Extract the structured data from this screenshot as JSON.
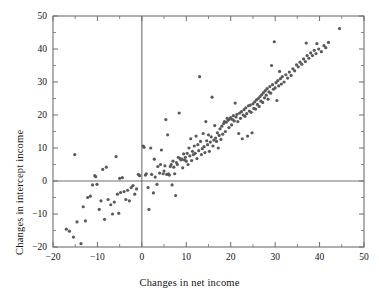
{
  "chart_data": {
    "type": "scatter",
    "title": "",
    "xlabel": "Changes in net income",
    "ylabel": "Changes in intercept income",
    "xlim": [
      -20,
      50
    ],
    "ylim": [
      -20,
      50
    ],
    "xticks": [
      -20,
      -10,
      0,
      10,
      20,
      30,
      40,
      50
    ],
    "yticks": [
      -20,
      -10,
      0,
      10,
      20,
      30,
      40,
      50
    ],
    "xticklabels": [
      "−20",
      "−10",
      "0",
      "10",
      "20",
      "30",
      "40",
      "50"
    ],
    "yticklabels": [
      "−20",
      "−10",
      "0",
      "10",
      "20",
      "30",
      "40",
      "50"
    ],
    "minor_tick_step": 5,
    "grid": false,
    "legend": null,
    "reference_lines": [
      {
        "axis": "horizontal",
        "value": 0
      },
      {
        "axis": "vertical",
        "value": 0
      }
    ],
    "marker": {
      "shape": "dot",
      "size": 1.6,
      "color": "#5a5a5a"
    },
    "frame_color": "#6e6e6e",
    "background": "#ffffff",
    "n_points": 224,
    "points": [
      [
        -17.0,
        -14.6
      ],
      [
        -16.3,
        -15.2
      ],
      [
        -15.4,
        -17.0
      ],
      [
        -15.1,
        8.0
      ],
      [
        -14.6,
        -12.4
      ],
      [
        -13.7,
        -19.0
      ],
      [
        -13.2,
        -7.8
      ],
      [
        -12.7,
        -12.1
      ],
      [
        -12.2,
        -5.0
      ],
      [
        -11.6,
        -4.6
      ],
      [
        -11.1,
        -1.2
      ],
      [
        -10.6,
        1.6
      ],
      [
        -10.4,
        1.3
      ],
      [
        -10.1,
        -1.0
      ],
      [
        -9.6,
        -8.6
      ],
      [
        -9.2,
        -6.0
      ],
      [
        -8.8,
        3.5
      ],
      [
        -8.4,
        -11.6
      ],
      [
        -8.0,
        4.2
      ],
      [
        -7.6,
        -5.6
      ],
      [
        -7.0,
        -7.2
      ],
      [
        -6.6,
        -10.0
      ],
      [
        -6.2,
        -6.4
      ],
      [
        -5.8,
        7.4
      ],
      [
        -5.5,
        -4.0
      ],
      [
        -5.2,
        -9.8
      ],
      [
        -5.0,
        0.8
      ],
      [
        -4.8,
        -3.5
      ],
      [
        -4.4,
        1.0
      ],
      [
        -4.0,
        -3.2
      ],
      [
        -3.6,
        -5.6
      ],
      [
        -3.2,
        -2.8
      ],
      [
        -2.8,
        -6.0
      ],
      [
        -2.4,
        -2.0
      ],
      [
        -2.0,
        -1.4
      ],
      [
        -1.6,
        -4.0
      ],
      [
        -1.2,
        -2.4
      ],
      [
        -0.8,
        2.0
      ],
      [
        -0.5,
        1.6
      ],
      [
        0.3,
        10.6
      ],
      [
        0.5,
        10.2
      ],
      [
        0.8,
        1.8
      ],
      [
        1.0,
        2.2
      ],
      [
        1.4,
        -2.0
      ],
      [
        1.6,
        -8.6
      ],
      [
        2.0,
        10.0
      ],
      [
        2.2,
        2.0
      ],
      [
        2.6,
        -3.6
      ],
      [
        2.8,
        6.6
      ],
      [
        3.0,
        1.2
      ],
      [
        3.4,
        -1.0
      ],
      [
        3.6,
        4.4
      ],
      [
        4.0,
        2.4
      ],
      [
        4.2,
        5.0
      ],
      [
        4.4,
        9.4
      ],
      [
        4.8,
        2.2
      ],
      [
        5.0,
        3.0
      ],
      [
        5.2,
        4.6
      ],
      [
        5.4,
        18.6
      ],
      [
        5.6,
        2.0
      ],
      [
        5.8,
        14.0
      ],
      [
        6.0,
        2.2
      ],
      [
        6.2,
        1.8
      ],
      [
        6.4,
        4.4
      ],
      [
        6.6,
        5.0
      ],
      [
        6.8,
        -1.2
      ],
      [
        7.0,
        6.0
      ],
      [
        7.2,
        4.2
      ],
      [
        7.4,
        2.2
      ],
      [
        7.6,
        -4.4
      ],
      [
        7.8,
        5.6
      ],
      [
        8.0,
        5.0
      ],
      [
        8.2,
        7.2
      ],
      [
        8.4,
        20.6
      ],
      [
        8.6,
        6.8
      ],
      [
        8.8,
        6.4
      ],
      [
        9.0,
        6.6
      ],
      [
        9.2,
        4.0
      ],
      [
        9.4,
        8.2
      ],
      [
        9.6,
        6.4
      ],
      [
        9.8,
        7.2
      ],
      [
        10.0,
        6.0
      ],
      [
        10.2,
        8.4
      ],
      [
        10.4,
        5.0
      ],
      [
        10.6,
        10.0
      ],
      [
        10.8,
        7.6
      ],
      [
        11.0,
        12.8
      ],
      [
        11.2,
        6.2
      ],
      [
        11.4,
        9.0
      ],
      [
        11.6,
        8.0
      ],
      [
        11.8,
        10.6
      ],
      [
        12.0,
        8.4
      ],
      [
        12.2,
        13.6
      ],
      [
        12.4,
        6.8
      ],
      [
        12.6,
        11.0
      ],
      [
        12.8,
        9.2
      ],
      [
        13.0,
        31.6
      ],
      [
        13.2,
        12.0
      ],
      [
        13.4,
        8.0
      ],
      [
        13.6,
        9.8
      ],
      [
        13.8,
        14.4
      ],
      [
        14.0,
        10.4
      ],
      [
        14.2,
        8.6
      ],
      [
        14.4,
        18.0
      ],
      [
        14.6,
        12.2
      ],
      [
        14.8,
        11.0
      ],
      [
        15.0,
        14.0
      ],
      [
        15.2,
        9.0
      ],
      [
        15.4,
        11.8
      ],
      [
        15.6,
        13.4
      ],
      [
        15.8,
        25.4
      ],
      [
        16.0,
        10.6
      ],
      [
        16.2,
        12.4
      ],
      [
        16.4,
        16.8
      ],
      [
        16.6,
        13.0
      ],
      [
        16.8,
        12.0
      ],
      [
        17.0,
        14.6
      ],
      [
        17.2,
        10.0
      ],
      [
        17.4,
        13.8
      ],
      [
        17.6,
        15.8
      ],
      [
        17.8,
        12.6
      ],
      [
        18.0,
        16.6
      ],
      [
        18.2,
        14.2
      ],
      [
        18.4,
        17.4
      ],
      [
        18.6,
        18.0
      ],
      [
        18.8,
        15.0
      ],
      [
        19.0,
        17.8
      ],
      [
        19.2,
        19.0
      ],
      [
        19.4,
        18.4
      ],
      [
        19.6,
        16.2
      ],
      [
        19.8,
        18.8
      ],
      [
        20.0,
        19.2
      ],
      [
        20.2,
        17.0
      ],
      [
        20.4,
        18.6
      ],
      [
        20.6,
        19.8
      ],
      [
        20.8,
        18.2
      ],
      [
        21.0,
        23.6
      ],
      [
        21.2,
        19.4
      ],
      [
        21.4,
        20.2
      ],
      [
        21.6,
        18.0
      ],
      [
        21.8,
        14.4
      ],
      [
        22.0,
        20.6
      ],
      [
        22.2,
        19.0
      ],
      [
        22.4,
        21.0
      ],
      [
        22.6,
        12.8
      ],
      [
        22.8,
        20.0
      ],
      [
        23.0,
        21.6
      ],
      [
        23.2,
        19.6
      ],
      [
        23.4,
        22.2
      ],
      [
        23.6,
        20.4
      ],
      [
        23.8,
        13.6
      ],
      [
        24.0,
        22.8
      ],
      [
        24.2,
        21.2
      ],
      [
        24.4,
        23.0
      ],
      [
        24.6,
        20.8
      ],
      [
        24.8,
        14.6
      ],
      [
        25.0,
        23.4
      ],
      [
        25.2,
        22.0
      ],
      [
        25.4,
        24.0
      ],
      [
        25.6,
        21.8
      ],
      [
        25.8,
        24.6
      ],
      [
        26.0,
        23.2
      ],
      [
        26.2,
        25.0
      ],
      [
        26.4,
        22.6
      ],
      [
        26.6,
        25.6
      ],
      [
        26.8,
        24.2
      ],
      [
        27.0,
        26.2
      ],
      [
        27.2,
        23.8
      ],
      [
        27.4,
        26.8
      ],
      [
        27.6,
        25.2
      ],
      [
        27.8,
        27.4
      ],
      [
        28.0,
        26.0
      ],
      [
        28.2,
        28.0
      ],
      [
        28.4,
        24.8
      ],
      [
        28.6,
        27.0
      ],
      [
        28.8,
        28.6
      ],
      [
        29.0,
        26.6
      ],
      [
        29.2,
        35.0
      ],
      [
        29.4,
        29.2
      ],
      [
        29.6,
        27.8
      ],
      [
        29.8,
        42.2
      ],
      [
        30.0,
        28.2
      ],
      [
        30.2,
        29.8
      ],
      [
        30.4,
        24.4
      ],
      [
        30.6,
        30.4
      ],
      [
        30.8,
        28.8
      ],
      [
        31.0,
        33.2
      ],
      [
        31.2,
        31.0
      ],
      [
        31.4,
        29.4
      ],
      [
        31.6,
        31.6
      ],
      [
        32.0,
        30.0
      ],
      [
        32.4,
        32.2
      ],
      [
        32.8,
        31.2
      ],
      [
        33.2,
        33.0
      ],
      [
        33.6,
        32.0
      ],
      [
        34.0,
        34.0
      ],
      [
        34.4,
        33.4
      ],
      [
        34.8,
        35.2
      ],
      [
        35.2,
        34.6
      ],
      [
        35.6,
        36.0
      ],
      [
        36.0,
        35.4
      ],
      [
        36.4,
        37.0
      ],
      [
        36.8,
        36.2
      ],
      [
        37.0,
        41.8
      ],
      [
        37.2,
        38.0
      ],
      [
        37.6,
        37.2
      ],
      [
        38.0,
        38.8
      ],
      [
        38.4,
        38.0
      ],
      [
        38.8,
        39.6
      ],
      [
        39.2,
        38.6
      ],
      [
        39.4,
        41.6
      ],
      [
        39.8,
        40.0
      ],
      [
        40.4,
        39.2
      ],
      [
        41.0,
        41.0
      ],
      [
        41.4,
        40.4
      ],
      [
        42.0,
        42.0
      ],
      [
        44.5,
        46.2
      ]
    ]
  },
  "figure": {
    "plot_left_px": 53,
    "plot_right_px": 364,
    "plot_top_px": 16,
    "plot_bottom_px": 247
  }
}
